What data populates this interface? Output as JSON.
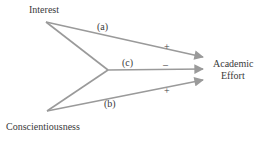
{
  "diagram": {
    "nodes": {
      "interest": "Interest",
      "conscientiousness": "Conscientiousness",
      "effort_line1": "Academic",
      "effort_line2": "Effort"
    },
    "paths": [
      {
        "id": "a",
        "label": "(a)",
        "sign": "+",
        "from": "Interest",
        "to": "Academic Effort"
      },
      {
        "id": "c",
        "label": "(c)",
        "sign": "–",
        "from": "Interest × Conscientiousness",
        "to": "Academic Effort"
      },
      {
        "id": "b",
        "label": "(b)",
        "sign": "+",
        "from": "Conscientiousness",
        "to": "Academic Effort"
      }
    ],
    "colors": {
      "line": "#9a9a9a",
      "text": "#3a3a3a"
    }
  }
}
